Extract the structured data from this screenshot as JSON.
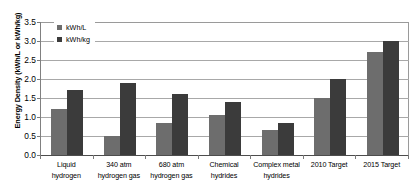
{
  "chart_data": {
    "type": "bar",
    "title": "",
    "xlabel": "",
    "ylabel": "Energy Density (kWh/L or kWh/kg)",
    "ylim": [
      0,
      3.5
    ],
    "ytick_labels": [
      "0.0",
      "0.5",
      "1.0",
      "1.5",
      "2.0",
      "2.5",
      "3.0",
      "3.5"
    ],
    "ytick_values": [
      0.0,
      0.5,
      1.0,
      1.5,
      2.0,
      2.5,
      3.0,
      3.5
    ],
    "grid": true,
    "legend_position": "top-left inside plot",
    "categories": [
      "Liquid hydrogen",
      "340 atm hydrogen gas",
      "680 atm hydrogen gas",
      "Chemical hydrides",
      "Complex metal hydrides",
      "2010 Target",
      "2015 Target"
    ],
    "category_lines": [
      [
        "Liquid",
        "hydrogen"
      ],
      [
        "340 atm",
        "hydrogen gas"
      ],
      [
        "680 atm",
        "hydrogen gas"
      ],
      [
        "Chemical",
        "hydrides"
      ],
      [
        "Complex metal",
        "hydrides"
      ],
      [
        "2010 Target",
        ""
      ],
      [
        "2015 Target",
        ""
      ]
    ],
    "series": [
      {
        "name": "kWh/L",
        "color": "#6d6d6d",
        "values": [
          1.2,
          0.5,
          0.85,
          1.05,
          0.65,
          1.5,
          2.7
        ]
      },
      {
        "name": "kWh/kg",
        "color": "#3b3b3b",
        "values": [
          1.7,
          1.9,
          1.6,
          1.4,
          0.85,
          2.0,
          3.0
        ]
      }
    ]
  },
  "legend": {
    "items": [
      {
        "label": "kWh/L",
        "color": "#6d6d6d"
      },
      {
        "label": "kWh/kg",
        "color": "#3b3b3b"
      }
    ]
  },
  "colors": {
    "series_light": "#6d6d6d",
    "series_dark": "#3b3b3b",
    "gridline": "#a8a8a8",
    "axis": "#4d4d4d",
    "background": "#ffffff"
  }
}
